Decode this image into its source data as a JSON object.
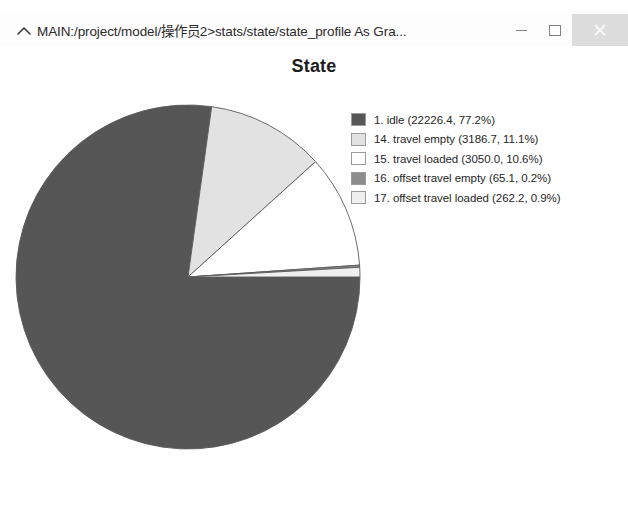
{
  "window": {
    "title": "MAIN:/project/model/操作员2>stats/state/state_profile As Gra...",
    "chevron_icon": "chevron-up-icon",
    "buttons": {
      "minimize_label": "–",
      "maximize_label": "□",
      "close_label": "×"
    },
    "close_button_background": "#dcdcdc"
  },
  "chart_data": {
    "type": "pie",
    "title": "State",
    "xlabel": "",
    "ylabel": "",
    "legend_position": "right",
    "grid": false,
    "start_angle_deg": 0,
    "direction": "clockwise",
    "categories": [
      "1. idle",
      "14. travel empty",
      "15. travel loaded",
      "16. offset travel empty",
      "17. offset travel loaded"
    ],
    "values": [
      22226.4,
      3186.7,
      3050.0,
      65.1,
      262.2
    ],
    "percents": [
      77.2,
      11.1,
      10.6,
      0.2,
      0.9
    ],
    "colors": [
      "#565656",
      "#e2e2e2",
      "#ffffff",
      "#8d8d8d",
      "#f0f0f0"
    ],
    "slices": [
      {
        "index": "1",
        "name": "idle",
        "value": 22226.4,
        "percent": 77.2,
        "color": "#565656",
        "legend_text": "1. idle (22226.4, 77.2%)"
      },
      {
        "index": "14",
        "name": "travel empty",
        "value": 3186.7,
        "percent": 11.1,
        "color": "#e2e2e2",
        "legend_text": "14. travel empty (3186.7, 11.1%)"
      },
      {
        "index": "15",
        "name": "travel loaded",
        "value": 3050.0,
        "percent": 10.6,
        "color": "#ffffff",
        "legend_text": "15. travel loaded (3050.0, 10.6%)"
      },
      {
        "index": "16",
        "name": "offset travel empty",
        "value": 65.1,
        "percent": 0.2,
        "color": "#8d8d8d",
        "legend_text": "16. offset travel empty (65.1, 0.2%)"
      },
      {
        "index": "17",
        "name": "offset travel loaded",
        "value": 262.2,
        "percent": 0.9,
        "color": "#f0f0f0",
        "legend_text": "17. offset travel loaded (262.2, 0.9%)"
      }
    ]
  }
}
